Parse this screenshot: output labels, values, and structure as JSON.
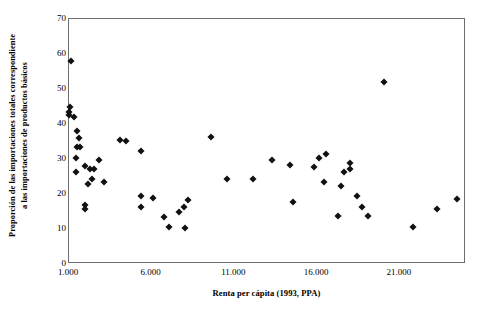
{
  "chart_data": {
    "type": "scatter",
    "title": "",
    "xlabel": "Renta per cápita (1993, PPA)",
    "ylabel_line1": "Proporción de las importaciones totales correspondiente",
    "ylabel_line2": "a las importaciones de productos básicos",
    "xlim": [
      1000,
      25000
    ],
    "ylim": [
      0,
      70
    ],
    "xticks": [
      1000,
      6000,
      11000,
      16000,
      21000
    ],
    "xticklabels": [
      "1.000",
      "6.000",
      "11.000",
      "16.000",
      "21.000"
    ],
    "yticks": [
      0,
      10,
      20,
      30,
      40,
      50,
      60,
      70
    ],
    "yticklabels": [
      "0",
      "10",
      "20",
      "30",
      "40",
      "50",
      "60",
      "70"
    ],
    "grid": false,
    "legend": false,
    "marker": "diamond",
    "marker_color": "#111111",
    "frame_color": "#6e6e6e",
    "background": "#ffffff",
    "points": [
      {
        "x": 1125,
        "y": 58.0
      },
      {
        "x": 1060,
        "y": 45.0
      },
      {
        "x": 1000,
        "y": 43.3
      },
      {
        "x": 1000,
        "y": 42.6
      },
      {
        "x": 1310,
        "y": 41.9
      },
      {
        "x": 1500,
        "y": 38.0
      },
      {
        "x": 1625,
        "y": 36.0
      },
      {
        "x": 1500,
        "y": 33.3
      },
      {
        "x": 1690,
        "y": 33.3
      },
      {
        "x": 1440,
        "y": 30.3
      },
      {
        "x": 1440,
        "y": 26.3
      },
      {
        "x": 1940,
        "y": 28.0
      },
      {
        "x": 2380,
        "y": 24.3
      },
      {
        "x": 2125,
        "y": 23.0
      },
      {
        "x": 2250,
        "y": 27.2
      },
      {
        "x": 2500,
        "y": 27.2
      },
      {
        "x": 2815,
        "y": 29.7
      },
      {
        "x": 3125,
        "y": 23.3
      },
      {
        "x": 1940,
        "y": 16.8
      },
      {
        "x": 1940,
        "y": 15.6
      },
      {
        "x": 4060,
        "y": 35.3
      },
      {
        "x": 4440,
        "y": 35.2
      },
      {
        "x": 5375,
        "y": 32.3
      },
      {
        "x": 5375,
        "y": 19.3
      },
      {
        "x": 5375,
        "y": 16.3
      },
      {
        "x": 6060,
        "y": 19.0
      },
      {
        "x": 6750,
        "y": 13.3
      },
      {
        "x": 7060,
        "y": 10.6
      },
      {
        "x": 7625,
        "y": 15.0
      },
      {
        "x": 7940,
        "y": 16.3
      },
      {
        "x": 8190,
        "y": 18.3
      },
      {
        "x": 8000,
        "y": 10.3
      },
      {
        "x": 9560,
        "y": 36.4
      },
      {
        "x": 10560,
        "y": 24.3
      },
      {
        "x": 12125,
        "y": 24.3
      },
      {
        "x": 13250,
        "y": 29.7
      },
      {
        "x": 14375,
        "y": 28.3
      },
      {
        "x": 14560,
        "y": 17.6
      },
      {
        "x": 15810,
        "y": 27.8
      },
      {
        "x": 16125,
        "y": 30.3
      },
      {
        "x": 16440,
        "y": 23.3
      },
      {
        "x": 16560,
        "y": 31.3
      },
      {
        "x": 17625,
        "y": 26.3
      },
      {
        "x": 17440,
        "y": 22.3
      },
      {
        "x": 18000,
        "y": 29.0
      },
      {
        "x": 18000,
        "y": 27.2
      },
      {
        "x": 17250,
        "y": 13.6
      },
      {
        "x": 18440,
        "y": 19.3
      },
      {
        "x": 18690,
        "y": 16.3
      },
      {
        "x": 19060,
        "y": 13.6
      },
      {
        "x": 20060,
        "y": 52.0
      },
      {
        "x": 21810,
        "y": 10.6
      },
      {
        "x": 23250,
        "y": 15.6
      },
      {
        "x": 24440,
        "y": 18.6
      }
    ]
  }
}
